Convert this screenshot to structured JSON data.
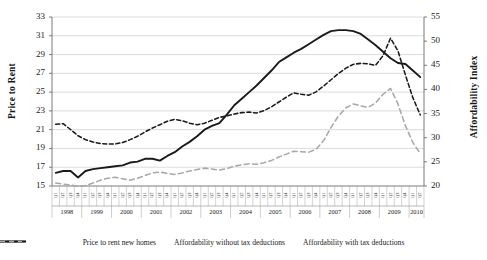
{
  "chart_data": {
    "type": "line",
    "title": "",
    "xlabel": "",
    "ylabel": "Price to Rent",
    "ylabel_secondary": "Affordability Index",
    "ylim": [
      15,
      33
    ],
    "ylim_secondary": [
      20,
      55
    ],
    "ytick_step": 2,
    "ytick_step_secondary": 5,
    "grid": true,
    "legend_position": "bottom",
    "yticks": [
      "15",
      "17",
      "19",
      "21",
      "23",
      "25",
      "27",
      "29",
      "31",
      "33"
    ],
    "yticks_secondary": [
      "20",
      "25",
      "30",
      "35",
      "40",
      "45",
      "50",
      "55"
    ],
    "years": [
      "1998",
      "1999",
      "2000",
      "2001",
      "2002",
      "2003",
      "2004",
      "2005",
      "2006",
      "2007",
      "2008",
      "2009",
      "2010"
    ],
    "quarters_per_year": [
      4,
      4,
      4,
      4,
      4,
      4,
      4,
      4,
      4,
      4,
      4,
      4,
      2
    ],
    "quarter_labels": [
      "Q1",
      "Q2",
      "Q3",
      "Q4"
    ],
    "x": [
      "1998Q1",
      "1998Q2",
      "1998Q3",
      "1998Q4",
      "1999Q1",
      "1999Q2",
      "1999Q3",
      "1999Q4",
      "2000Q1",
      "2000Q2",
      "2000Q3",
      "2000Q4",
      "2001Q1",
      "2001Q2",
      "2001Q3",
      "2001Q4",
      "2002Q1",
      "2002Q2",
      "2002Q3",
      "2002Q4",
      "2003Q1",
      "2003Q2",
      "2003Q3",
      "2003Q4",
      "2004Q1",
      "2004Q2",
      "2004Q3",
      "2004Q4",
      "2005Q1",
      "2005Q2",
      "2005Q3",
      "2005Q4",
      "2006Q1",
      "2006Q2",
      "2006Q3",
      "2006Q4",
      "2007Q1",
      "2007Q2",
      "2007Q3",
      "2007Q4",
      "2008Q1",
      "2008Q2",
      "2008Q3",
      "2008Q4",
      "2009Q1",
      "2009Q2",
      "2009Q3",
      "2009Q4",
      "2010Q1",
      "2010Q2"
    ],
    "series": [
      {
        "name": "Price to rent new homes",
        "axis": "left",
        "color": "#1a1a1a",
        "style": "solid",
        "values": [
          16.4,
          16.6,
          16.6,
          15.9,
          16.6,
          16.8,
          16.9,
          17.0,
          17.1,
          17.2,
          17.5,
          17.6,
          17.9,
          17.9,
          17.7,
          18.2,
          18.6,
          19.2,
          19.7,
          20.3,
          21.0,
          21.4,
          21.7,
          22.6,
          23.6,
          24.3,
          25.0,
          25.7,
          26.5,
          27.3,
          28.2,
          28.7,
          29.2,
          29.6,
          30.1,
          30.6,
          31.1,
          31.5,
          31.6,
          31.6,
          31.5,
          31.2,
          30.6,
          30.0,
          29.3,
          28.6,
          28.1,
          28.0,
          27.3,
          26.6
        ]
      },
      {
        "name": "Affordability without tax deductions",
        "axis": "right",
        "color": "#1a1a1a",
        "style": "dashed",
        "values": [
          32.8,
          32.9,
          31.7,
          30.4,
          29.6,
          29.1,
          28.8,
          28.7,
          28.7,
          29.0,
          29.6,
          30.3,
          31.2,
          32.0,
          32.7,
          33.4,
          33.8,
          33.5,
          33.0,
          32.7,
          33.0,
          33.6,
          34.2,
          34.5,
          34.9,
          35.2,
          35.3,
          35.1,
          35.6,
          36.4,
          37.4,
          38.4,
          39.3,
          39.0,
          38.8,
          39.5,
          40.7,
          42.0,
          43.3,
          44.4,
          45.2,
          45.4,
          45.3,
          45.0,
          47.0,
          50.6,
          48.0,
          43.0,
          38.3,
          34.7
        ]
      },
      {
        "name": "Affordability with tax deductions",
        "axis": "right",
        "color": "#a8a8a8",
        "style": "dashed",
        "values": [
          20.6,
          20.4,
          20.2,
          19.9,
          20.1,
          20.6,
          21.2,
          21.6,
          21.8,
          21.5,
          21.2,
          21.6,
          22.2,
          22.7,
          22.9,
          22.6,
          22.4,
          22.7,
          23.1,
          23.4,
          23.7,
          23.5,
          23.3,
          23.6,
          24.1,
          24.4,
          24.6,
          24.5,
          24.8,
          25.3,
          26.0,
          26.6,
          27.2,
          27.1,
          27.0,
          27.6,
          29.4,
          32.1,
          34.5,
          36.2,
          37.0,
          36.6,
          36.3,
          37.2,
          39.0,
          40.2,
          37.0,
          32.5,
          29.0,
          26.7
        ]
      }
    ]
  }
}
